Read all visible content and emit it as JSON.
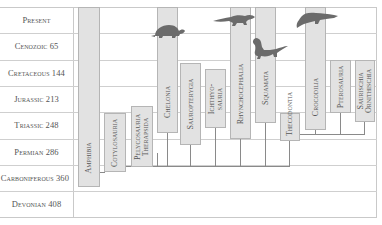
{
  "diagram": {
    "periods": [
      {
        "label": "Present"
      },
      {
        "label": "Cenozoic 65"
      },
      {
        "label": "Cretaceous 144"
      },
      {
        "label": "Jurassic 213"
      },
      {
        "label": "Triassic 248"
      },
      {
        "label": "Permian 286"
      },
      {
        "label": "Carboniferous 360"
      },
      {
        "label": "Devonian 408"
      }
    ],
    "groups": [
      {
        "line1": "Amphibia",
        "line2": ""
      },
      {
        "line1": "Cotylosauria",
        "line2": ""
      },
      {
        "line1": "Pelycosauria",
        "line2": "Therapsida"
      },
      {
        "line1": "Chelonia",
        "line2": ""
      },
      {
        "line1": "Sauropterygia",
        "line2": ""
      },
      {
        "line1": "Ichthyo-",
        "line2": "sauria"
      },
      {
        "line1": "Rhynchocephalia",
        "line2": ""
      },
      {
        "line1": "Squamata",
        "line2": ""
      },
      {
        "line1": "Thecodontia",
        "line2": ""
      },
      {
        "line1": "Crocodilia",
        "line2": ""
      },
      {
        "line1": "Pterosauria",
        "line2": ""
      },
      {
        "line1": "Saurischia",
        "line2": "Ornithischia"
      }
    ],
    "icons": {
      "turtle": "turtle-silhouette",
      "tuatara": "tuatara-silhouette",
      "lizard": "lizard-silhouette",
      "crocodile": "crocodile-silhouette"
    },
    "colors": {
      "bar_fill": "#e2e2e2",
      "bar_border": "#b5b5b5",
      "line": "#8a8a8a",
      "grid": "#cfcfcf",
      "text": "#555555",
      "silhouette": "#6b6b6b"
    }
  }
}
